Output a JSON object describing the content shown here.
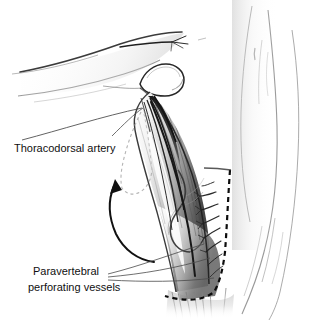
{
  "figure": {
    "background_color": "#ffffff",
    "ink_color": "#101010",
    "width": 310,
    "height": 321
  },
  "labels": {
    "thoracodorsal_artery": "Thoracodorsal artery",
    "paravertebral_line1": "Paravertebral",
    "paravertebral_line2": "perforating vessels"
  },
  "annotations": {
    "rotation_arrow": "curved-rotation-arrow",
    "flap_outline": "dashed-flap-island-outline",
    "incision_line": "dashed-medial-border-line"
  },
  "anatomy": {
    "parts": [
      "abducted-arm",
      "humeral-head",
      "axilla",
      "latissimus-dorsi-muscle",
      "thoracodorsal-pedicle",
      "perforating-vessels",
      "torso-back-contour"
    ]
  }
}
